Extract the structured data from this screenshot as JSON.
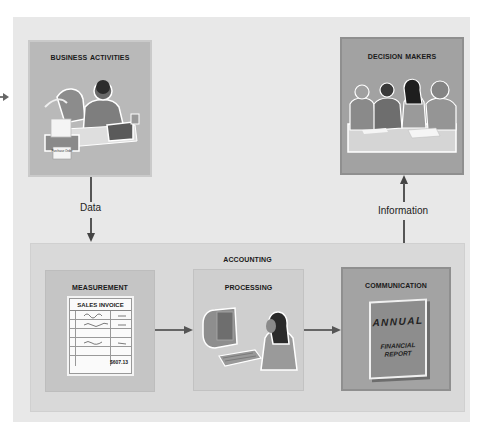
{
  "diagram": {
    "type": "accounting-information-flow",
    "nodes": {
      "business_activities": {
        "title": "Business Activities",
        "illustration": "person at desk with printer and laptop",
        "printer_label": "Purchase Order"
      },
      "decision_makers": {
        "title": "Decision Makers",
        "illustration": "group of four people at a meeting table"
      },
      "accounting": {
        "title": "Accounting",
        "steps": [
          {
            "title": "Measurement",
            "illustration": "sales invoice document"
          },
          {
            "title": "Processing",
            "illustration": "person at computer terminal"
          },
          {
            "title": "Communication",
            "illustration": "annual financial report book"
          }
        ]
      }
    },
    "edges": {
      "data": {
        "from": "Business Activities",
        "to": "Accounting",
        "label": "Data"
      },
      "info": {
        "from": "Accounting",
        "to": "Decision Makers",
        "label": "Information"
      },
      "m_to_p": {
        "from": "Measurement",
        "to": "Processing"
      },
      "p_to_c": {
        "from": "Processing",
        "to": "Communication"
      }
    },
    "invoice": {
      "title": "SALES INVOICE",
      "total": "$607.13"
    },
    "report": {
      "line1": "ANNUAL",
      "line2": "FINANCIAL",
      "line3": "REPORT"
    }
  },
  "colors": {
    "outer_panel": "#e8e8e8",
    "business_box": "#b9b9b9",
    "decision_box": "#a2a2a2",
    "accounting_panel": "#d9d9d9",
    "measurement_box": "#c5c5c5",
    "processing_box": "#cfcfcf",
    "communication_box": "#a3a3a3",
    "arrow": "#555555"
  }
}
